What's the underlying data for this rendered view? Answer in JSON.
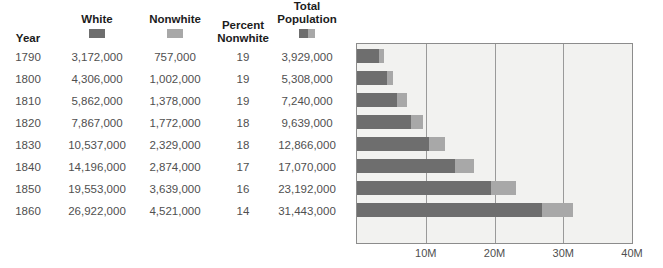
{
  "table": {
    "columns": [
      {
        "key": "year",
        "label": "Year",
        "swatch": "none"
      },
      {
        "key": "white",
        "label": "White",
        "swatch": "dark"
      },
      {
        "key": "nonwhite",
        "label": "Nonwhite",
        "swatch": "light"
      },
      {
        "key": "percent_nonwhite",
        "label": "Percent\nNonwhite",
        "swatch": "none"
      },
      {
        "key": "total",
        "label": "Total\nPopulation",
        "swatch": "split"
      }
    ],
    "header_labels": {
      "year": "Year",
      "white": "White",
      "nonwhite": "Nonwhite",
      "percent_nonwhite_line1": "Percent",
      "percent_nonwhite_line2": "Nonwhite",
      "total_line1": "Total",
      "total_line2": "Population"
    },
    "rows": [
      {
        "year": "1790",
        "white": "3,172,000",
        "nonwhite": "757,000",
        "percent_nonwhite": "19",
        "total": "3,929,000"
      },
      {
        "year": "1800",
        "white": "4,306,000",
        "nonwhite": "1,002,000",
        "percent_nonwhite": "19",
        "total": "5,308,000"
      },
      {
        "year": "1810",
        "white": "5,862,000",
        "nonwhite": "1,378,000",
        "percent_nonwhite": "19",
        "total": "7,240,000"
      },
      {
        "year": "1820",
        "white": "7,867,000",
        "nonwhite": "1,772,000",
        "percent_nonwhite": "18",
        "total": "9,639,000"
      },
      {
        "year": "1830",
        "white": "10,537,000",
        "nonwhite": "2,329,000",
        "percent_nonwhite": "18",
        "total": "12,866,000"
      },
      {
        "year": "1840",
        "white": "14,196,000",
        "nonwhite": "2,874,000",
        "percent_nonwhite": "17",
        "total": "17,070,000"
      },
      {
        "year": "1850",
        "white": "19,553,000",
        "nonwhite": "3,639,000",
        "percent_nonwhite": "16",
        "total": "23,192,000"
      },
      {
        "year": "1860",
        "white": "26,922,000",
        "nonwhite": "4,521,000",
        "percent_nonwhite": "14",
        "total": "31,443,000"
      }
    ]
  },
  "colors": {
    "white_series": "#6e6e6e",
    "nonwhite_series": "#a8a8a8",
    "plot_background": "#f2f2f0",
    "plot_border": "#8c8c8c",
    "gridline": "#9a9a9a",
    "header_text": "#1c1c1c",
    "body_text": "#4f4f4f"
  },
  "chart_data": {
    "type": "bar",
    "orientation": "horizontal",
    "stacked": true,
    "title": "",
    "subtitle": "",
    "xlabel": "",
    "ylabel": "",
    "categories": [
      "1790",
      "1800",
      "1810",
      "1820",
      "1830",
      "1840",
      "1850",
      "1860"
    ],
    "series": [
      {
        "name": "White",
        "color": "#6e6e6e",
        "values": [
          3172000,
          4306000,
          5862000,
          7867000,
          10537000,
          14196000,
          19553000,
          26922000
        ]
      },
      {
        "name": "Nonwhite",
        "color": "#a8a8a8",
        "values": [
          757000,
          1002000,
          1378000,
          1772000,
          2329000,
          2874000,
          3639000,
          4521000
        ]
      }
    ],
    "totals": [
      3929000,
      5308000,
      7240000,
      9639000,
      12866000,
      17070000,
      23192000,
      31443000
    ],
    "percent_nonwhite": [
      19,
      19,
      19,
      18,
      18,
      17,
      16,
      14
    ],
    "xlim": [
      0,
      40000000
    ],
    "xticks": [
      10000000,
      20000000,
      30000000,
      40000000
    ],
    "xtick_labels": [
      "10M",
      "20M",
      "30M",
      "40M"
    ],
    "grid": true,
    "grid_axis": "x",
    "legend": [
      "White",
      "Nonwhite"
    ],
    "legend_position": "table-header"
  }
}
